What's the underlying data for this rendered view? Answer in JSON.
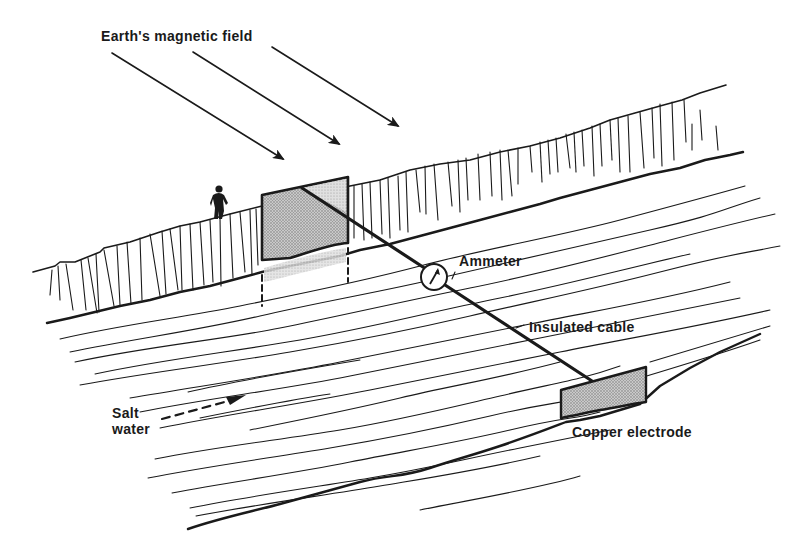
{
  "figure": {
    "type": "scientific-illustration"
  },
  "labels": {
    "magnetic_field": "Earth's magnetic field",
    "ammeter": "Ammeter",
    "insulated_cable": "Insulated cable",
    "salt_water_line1": "Salt",
    "salt_water_line2": "water",
    "copper_electrode": "Copper electrode"
  },
  "elements": {
    "field_arrows": {
      "count": 3,
      "direction": "down-right",
      "icon": "arrow-icon"
    },
    "far_electrode": {
      "shape": "quadrilateral",
      "fill": "stippled-gray",
      "location": "far bank"
    },
    "near_electrode": {
      "shape": "quadrilateral",
      "fill": "stippled-gray",
      "location": "near bank"
    },
    "ammeter": {
      "icon": "ammeter-dial-icon"
    },
    "flow_arrow": {
      "style": "dashed",
      "icon": "dashed-arrow-icon"
    },
    "person": {
      "icon": "person-silhouette-icon",
      "location": "cliff top"
    }
  },
  "colors": {
    "ink": "#1a1a1a",
    "stipple_fill": "#b8b8b8",
    "background": "#ffffff"
  }
}
